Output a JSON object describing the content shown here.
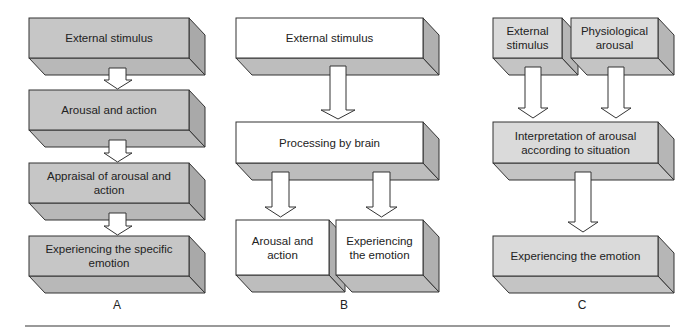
{
  "panels": {
    "A": {
      "label": "A",
      "boxes": [
        "External stimulus",
        "Arousal and action",
        "Appraisal of arousal and action",
        "Experiencing the specific emotion"
      ],
      "fill": "#c6c6c6"
    },
    "B": {
      "label": "B",
      "boxes": [
        "External stimulus",
        "Processing by brain",
        "Arousal and action",
        "Experiencing the emotion"
      ],
      "fill": "#ffffff"
    },
    "C": {
      "label": "C",
      "boxes": [
        "External stimulus",
        "Physiological arousal",
        "Interpretation of arousal according to situation",
        "Experiencing the emotion"
      ],
      "fill": "#dadada"
    }
  },
  "colors": {
    "stroke": "#333333",
    "side_face": "#b0b0b0",
    "bottom_face": "#bdbdbd",
    "arrow_fill": "#ffffff",
    "rule": "#999999"
  }
}
